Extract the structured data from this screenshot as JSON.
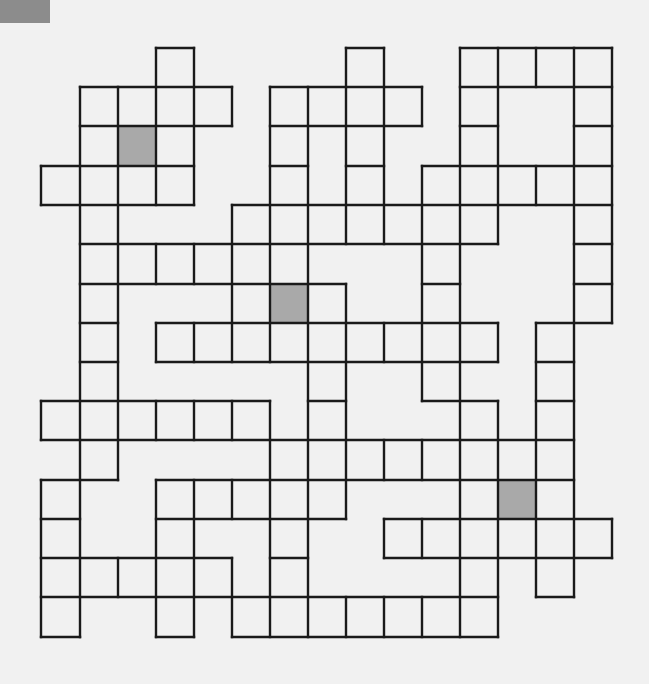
{
  "puzzle": {
    "title": "Crossword grid",
    "paper_color": "#f1f1f1",
    "line_color": "#1a1a1a",
    "shade_color": "#a9a9a9",
    "corner_mark_color": "#8c8c8c",
    "grid_x": [
      41,
      80,
      118,
      156,
      194,
      232,
      270,
      308,
      346,
      384,
      422,
      460,
      498,
      536,
      574,
      612
    ],
    "grid_y": [
      48,
      87,
      126,
      166,
      205,
      244,
      284,
      323,
      362,
      401,
      440,
      480,
      519,
      558,
      597,
      637
    ],
    "shaded_cells": [
      {
        "col": 2,
        "row": 2
      },
      {
        "col": 6,
        "row": 6
      },
      {
        "col": 12,
        "row": 11
      }
    ],
    "h_lines": [
      {
        "row": 0,
        "spans": [
          [
            3,
            4
          ],
          [
            8,
            9
          ],
          [
            11,
            15
          ]
        ]
      },
      {
        "row": 1,
        "spans": [
          [
            1,
            5
          ],
          [
            6,
            10
          ],
          [
            11,
            15
          ]
        ]
      },
      {
        "row": 2,
        "spans": [
          [
            1,
            5
          ],
          [
            6,
            10
          ],
          [
            11,
            12
          ],
          [
            14,
            15
          ]
        ]
      },
      {
        "row": 3,
        "spans": [
          [
            0,
            4
          ],
          [
            6,
            7
          ],
          [
            8,
            9
          ],
          [
            10,
            15
          ]
        ]
      },
      {
        "row": 4,
        "spans": [
          [
            0,
            4
          ],
          [
            5,
            15
          ]
        ]
      },
      {
        "row": 5,
        "spans": [
          [
            1,
            12
          ],
          [
            14,
            15
          ]
        ]
      },
      {
        "row": 6,
        "spans": [
          [
            1,
            8
          ],
          [
            10,
            11
          ],
          [
            14,
            15
          ]
        ]
      },
      {
        "row": 7,
        "spans": [
          [
            1,
            2
          ],
          [
            3,
            12
          ],
          [
            13,
            15
          ]
        ]
      },
      {
        "row": 8,
        "spans": [
          [
            1,
            2
          ],
          [
            3,
            12
          ],
          [
            13,
            14
          ]
        ]
      },
      {
        "row": 9,
        "spans": [
          [
            0,
            6
          ],
          [
            7,
            8
          ],
          [
            10,
            12
          ],
          [
            13,
            14
          ]
        ]
      },
      {
        "row": 10,
        "spans": [
          [
            0,
            14
          ]
        ]
      },
      {
        "row": 11,
        "spans": [
          [
            0,
            2
          ],
          [
            3,
            14
          ]
        ]
      },
      {
        "row": 12,
        "spans": [
          [
            0,
            1
          ],
          [
            3,
            8
          ],
          [
            9,
            15
          ]
        ]
      },
      {
        "row": 13,
        "spans": [
          [
            0,
            5
          ],
          [
            6,
            7
          ],
          [
            9,
            15
          ]
        ]
      },
      {
        "row": 14,
        "spans": [
          [
            0,
            12
          ],
          [
            13,
            14
          ]
        ]
      },
      {
        "row": 15,
        "spans": [
          [
            0,
            1
          ],
          [
            3,
            4
          ],
          [
            5,
            12
          ]
        ]
      }
    ],
    "v_lines": [
      {
        "col": 0,
        "spans": [
          [
            3,
            4
          ],
          [
            9,
            10
          ],
          [
            11,
            15
          ]
        ]
      },
      {
        "col": 1,
        "spans": [
          [
            1,
            15
          ]
        ]
      },
      {
        "col": 2,
        "spans": [
          [
            1,
            11
          ],
          [
            13,
            14
          ]
        ]
      },
      {
        "col": 3,
        "spans": [
          [
            0,
            4
          ],
          [
            5,
            6
          ],
          [
            7,
            8
          ],
          [
            9,
            10
          ],
          [
            11,
            15
          ]
        ]
      },
      {
        "col": 4,
        "spans": [
          [
            0,
            4
          ],
          [
            5,
            6
          ],
          [
            7,
            8
          ],
          [
            9,
            10
          ],
          [
            11,
            15
          ]
        ]
      },
      {
        "col": 5,
        "spans": [
          [
            1,
            2
          ],
          [
            4,
            8
          ],
          [
            9,
            10
          ],
          [
            11,
            12
          ],
          [
            13,
            15
          ]
        ]
      },
      {
        "col": 6,
        "spans": [
          [
            1,
            8
          ],
          [
            9,
            15
          ]
        ]
      },
      {
        "col": 7,
        "spans": [
          [
            1,
            15
          ]
        ]
      },
      {
        "col": 8,
        "spans": [
          [
            0,
            5
          ],
          [
            6,
            12
          ],
          [
            14,
            15
          ]
        ]
      },
      {
        "col": 9,
        "spans": [
          [
            0,
            5
          ],
          [
            7,
            8
          ],
          [
            10,
            11
          ],
          [
            12,
            13
          ],
          [
            14,
            15
          ]
        ]
      },
      {
        "col": 10,
        "spans": [
          [
            1,
            2
          ],
          [
            3,
            9
          ],
          [
            10,
            11
          ],
          [
            12,
            13
          ],
          [
            14,
            15
          ]
        ]
      },
      {
        "col": 11,
        "spans": [
          [
            0,
            15
          ]
        ]
      },
      {
        "col": 12,
        "spans": [
          [
            0,
            5
          ],
          [
            7,
            8
          ],
          [
            9,
            15
          ]
        ]
      },
      {
        "col": 13,
        "spans": [
          [
            0,
            1
          ],
          [
            3,
            4
          ],
          [
            7,
            14
          ]
        ]
      },
      {
        "col": 14,
        "spans": [
          [
            0,
            14
          ]
        ]
      },
      {
        "col": 15,
        "spans": [
          [
            0,
            7
          ],
          [
            12,
            13
          ]
        ]
      }
    ]
  }
}
